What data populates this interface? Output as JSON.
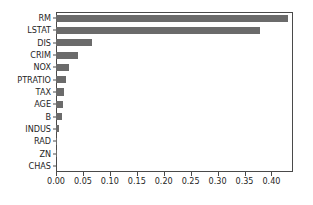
{
  "chart_data": {
    "type": "bar",
    "orientation": "horizontal",
    "title": "",
    "xlabel": "",
    "ylabel": "",
    "categories": [
      "RM",
      "LSTAT",
      "DIS",
      "CRIM",
      "NOX",
      "PTRATIO",
      "TAX",
      "AGE",
      "B",
      "INDUS",
      "RAD",
      "ZN",
      "CHAS"
    ],
    "values": [
      0.43,
      0.378,
      0.066,
      0.04,
      0.025,
      0.018,
      0.014,
      0.013,
      0.012,
      0.005,
      0.002,
      0.0005,
      0.0
    ],
    "xlim": [
      0.0,
      0.44
    ],
    "ylim": [
      -0.5,
      12.5
    ],
    "xticks": [
      0.0,
      0.05,
      0.1,
      0.15,
      0.2,
      0.25,
      0.3,
      0.35,
      0.4
    ],
    "xtick_labels": [
      "0.00",
      "0.05",
      "0.10",
      "0.15",
      "0.20",
      "0.25",
      "0.30",
      "0.35",
      "0.40"
    ],
    "grid": false,
    "legend": null,
    "bar_color": "#6b6b6b",
    "axis_color": "#4a4a4a",
    "text_color": "#262626",
    "background": "#ffffff"
  }
}
